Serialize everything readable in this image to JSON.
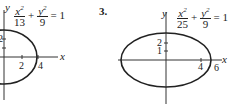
{
  "figures": [
    {
      "id": "left",
      "equation": {
        "x_num": "x",
        "x_den": "13",
        "y_num": "y",
        "y_den": "9",
        "plus": "+",
        "equals": "= 1"
      },
      "x_axis_label": "x",
      "y_axis_label": "y",
      "x_ticks": [
        "2",
        "4"
      ],
      "y_ticks": [
        "2"
      ]
    },
    {
      "id": "right",
      "problem_number": "3.",
      "equation": {
        "x_num": "x",
        "x_den": "25",
        "y_num": "y",
        "y_den": "9",
        "plus": "+",
        "equals": "= 1"
      },
      "x_axis_label": "x",
      "y_axis_label": "y",
      "x_ticks": [
        "4",
        "6"
      ],
      "y_ticks": [
        "2",
        "1"
      ]
    }
  ]
}
